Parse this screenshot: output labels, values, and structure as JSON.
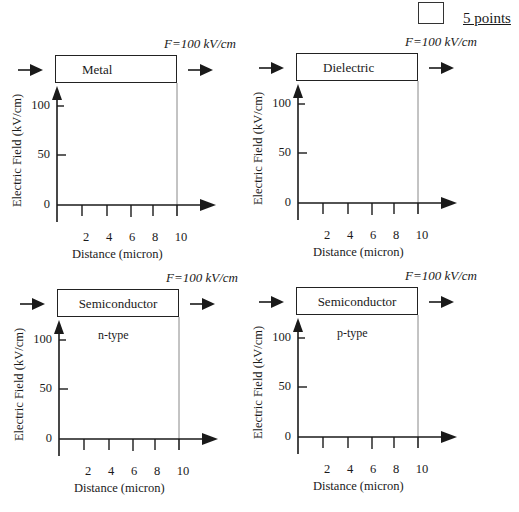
{
  "header": {
    "points_label": "5 points"
  },
  "panels": [
    {
      "id": "metal",
      "material": "Metal",
      "sublabel": "",
      "field_label": "F=100 kV/cm",
      "y_axis_label": "Electric Field (kV/cm)",
      "x_axis_label": "Distance (micron)",
      "y_ticks": [
        "100",
        "50",
        "0"
      ],
      "x_ticks": [
        "2",
        "4",
        "6",
        "8",
        "10"
      ]
    },
    {
      "id": "dielectric",
      "material": "Dielectric",
      "sublabel": "",
      "field_label": "F=100 kV/cm",
      "y_axis_label": "Electric Field (kV/cm)",
      "x_axis_label": "Distance (micron)",
      "y_ticks": [
        "100",
        "50",
        "0"
      ],
      "x_ticks": [
        "2",
        "4",
        "6",
        "8",
        "10"
      ]
    },
    {
      "id": "semiconductor-n",
      "material": "Semiconductor",
      "sublabel": "n-type",
      "field_label": "F=100 kV/cm",
      "y_axis_label": "Electric Field (kV/cm)",
      "x_axis_label": "Distance (micron)",
      "y_ticks": [
        "100",
        "50",
        "0"
      ],
      "x_ticks": [
        "2",
        "4",
        "6",
        "8",
        "10"
      ]
    },
    {
      "id": "semiconductor-p",
      "material": "Semiconductor",
      "sublabel": "p-type",
      "field_label": "F=100 kV/cm",
      "y_axis_label": "Electric Field (kV/cm)",
      "x_axis_label": "Distance (micron)",
      "y_ticks": [
        "100",
        "50",
        "0"
      ],
      "x_ticks": [
        "2",
        "4",
        "6",
        "8",
        "10"
      ]
    }
  ],
  "colors": {
    "ink": "#1a1a1a",
    "boundary_line": "#888888",
    "background": "#ffffff"
  }
}
